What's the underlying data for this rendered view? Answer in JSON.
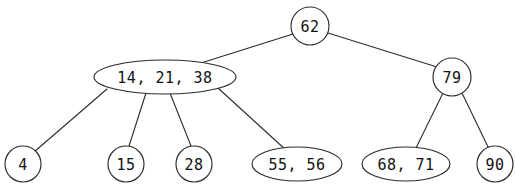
{
  "figure": {
    "background_color": "#ffffff",
    "stroke_color": "#2b2b2b",
    "text_color": "#111111",
    "width": 516,
    "height": 195
  },
  "nodes": [
    {
      "id": "root",
      "label": "62",
      "shape": "circle",
      "cx": 310,
      "cy": 26,
      "rx": 19,
      "ry": 19,
      "keys": [
        62
      ]
    },
    {
      "id": "internal-left",
      "label": "14, 21, 38",
      "shape": "ellipse",
      "cx": 165,
      "cy": 77,
      "rx": 71,
      "ry": 17,
      "keys": [
        14,
        21,
        38
      ]
    },
    {
      "id": "internal-right",
      "label": "79",
      "shape": "circle",
      "cx": 452,
      "cy": 77,
      "rx": 19,
      "ry": 19,
      "keys": [
        79
      ]
    },
    {
      "id": "leaf-4",
      "label": "4",
      "shape": "circle",
      "cx": 23,
      "cy": 164,
      "rx": 18,
      "ry": 18,
      "keys": [
        4
      ]
    },
    {
      "id": "leaf-15",
      "label": "15",
      "shape": "circle",
      "cx": 126,
      "cy": 164,
      "rx": 18,
      "ry": 18,
      "keys": [
        15
      ]
    },
    {
      "id": "leaf-28",
      "label": "28",
      "shape": "circle",
      "cx": 194,
      "cy": 164,
      "rx": 18,
      "ry": 18,
      "keys": [
        28
      ]
    },
    {
      "id": "leaf-55-56",
      "label": "55, 56",
      "shape": "ellipse",
      "cx": 297,
      "cy": 164,
      "rx": 45,
      "ry": 17,
      "keys": [
        55,
        56
      ]
    },
    {
      "id": "leaf-68-71",
      "label": "68, 71",
      "shape": "ellipse",
      "cx": 406,
      "cy": 164,
      "rx": 44,
      "ry": 17,
      "keys": [
        68,
        71
      ]
    },
    {
      "id": "leaf-90",
      "label": "90",
      "shape": "circle",
      "cx": 495,
      "cy": 164,
      "rx": 18,
      "ry": 18,
      "keys": [
        90
      ]
    }
  ],
  "edges": [
    {
      "id": "edge-root-left",
      "from": "root",
      "to": "internal-left",
      "x1": 293,
      "y1": 34,
      "x2": 201,
      "y2": 63
    },
    {
      "id": "edge-root-right",
      "from": "root",
      "to": "internal-right",
      "x1": 328,
      "y1": 33,
      "x2": 437,
      "y2": 67
    },
    {
      "id": "edge-left-4",
      "from": "internal-left",
      "to": "leaf-4",
      "x1": 107,
      "y1": 89,
      "x2": 34,
      "y2": 152
    },
    {
      "id": "edge-left-15",
      "from": "internal-left",
      "to": "leaf-15",
      "x1": 146,
      "y1": 93,
      "x2": 129,
      "y2": 146
    },
    {
      "id": "edge-left-28",
      "from": "internal-left",
      "to": "leaf-28",
      "x1": 170,
      "y1": 93,
      "x2": 191,
      "y2": 146
    },
    {
      "id": "edge-left-55",
      "from": "internal-left",
      "to": "leaf-55-56",
      "x1": 218,
      "y1": 88,
      "x2": 287,
      "y2": 151
    },
    {
      "id": "edge-right-68",
      "from": "internal-right",
      "to": "leaf-68-71",
      "x1": 443,
      "y1": 93,
      "x2": 415,
      "y2": 150
    },
    {
      "id": "edge-right-90",
      "from": "internal-right",
      "to": "leaf-90",
      "x1": 462,
      "y1": 93,
      "x2": 489,
      "y2": 149
    }
  ]
}
